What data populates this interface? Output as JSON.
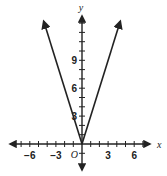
{
  "chart_data": {
    "type": "line",
    "title": "",
    "function": "y = 3|x|",
    "xlabel": "x",
    "ylabel": "y",
    "origin_label": "O",
    "xlim": [
      -8,
      7.5
    ],
    "ylim": [
      -2,
      14
    ],
    "x_ticks": [
      -6,
      -3,
      3,
      6
    ],
    "x_tick_labels": [
      "−6",
      "−3",
      "3",
      "6"
    ],
    "y_ticks": [
      3,
      6,
      9
    ],
    "y_tick_labels": [
      "3",
      "6",
      "9"
    ],
    "minor_tick_step": 1,
    "grid": false,
    "series": [
      {
        "name": "y = 3|x|",
        "points": [
          [
            -4.4,
            13.2
          ],
          [
            0,
            0
          ],
          [
            4.4,
            13.2
          ]
        ],
        "color": "#222222",
        "arrows": true
      }
    ]
  }
}
